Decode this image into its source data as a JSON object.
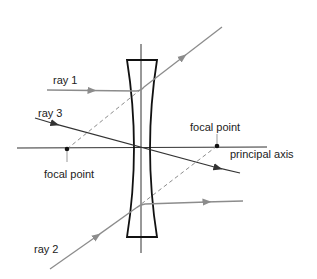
{
  "diagram": {
    "type": "diverging-lens-ray-diagram",
    "labels": {
      "ray1": "ray 1",
      "ray2": "ray 2",
      "ray3": "ray 3",
      "focal_point_left": "focal point",
      "focal_point_right": "focal point",
      "principal_axis": "principal axis"
    },
    "colors": {
      "lens": "#111111",
      "axis": "#333333",
      "ray_gray": "#8c8c8c",
      "ray3": "#333333",
      "dashed": "#8c8c8c",
      "text": "#222222",
      "background": "#ffffff"
    }
  }
}
